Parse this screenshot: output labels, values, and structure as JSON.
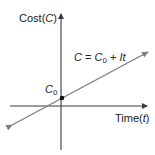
{
  "diagram": {
    "y_axis": {
      "label_text": "Cost",
      "label_var": "C"
    },
    "x_axis": {
      "label_text": "Time",
      "label_var": "t"
    },
    "equation": {
      "lhs": "C",
      "eq": " = ",
      "c": "C",
      "sub": "0",
      "plus": " + ",
      "term": "It"
    },
    "intercept_label": {
      "var": "C",
      "sub": "0"
    },
    "colors": {
      "axis": "#3a3a3a",
      "line": "#7d7d7d",
      "point": "#111111",
      "text": "#222222"
    }
  }
}
